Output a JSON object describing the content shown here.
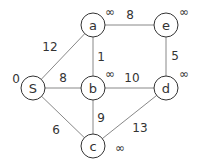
{
  "graph": {
    "nodes": [
      {
        "id": "S",
        "label": "S",
        "dist": "0"
      },
      {
        "id": "a",
        "label": "a",
        "dist": "∞"
      },
      {
        "id": "b",
        "label": "b",
        "dist": "∞"
      },
      {
        "id": "c",
        "label": "c",
        "dist": "∞"
      },
      {
        "id": "d",
        "label": "d",
        "dist": "∞"
      },
      {
        "id": "e",
        "label": "e",
        "dist": "∞"
      }
    ],
    "edges": [
      {
        "from": "S",
        "to": "a",
        "weight": "12"
      },
      {
        "from": "S",
        "to": "b",
        "weight": "8"
      },
      {
        "from": "S",
        "to": "c",
        "weight": "6"
      },
      {
        "from": "a",
        "to": "b",
        "weight": "1"
      },
      {
        "from": "a",
        "to": "e",
        "weight": "8"
      },
      {
        "from": "b",
        "to": "d",
        "weight": "10"
      },
      {
        "from": "b",
        "to": "c",
        "weight": "9"
      },
      {
        "from": "e",
        "to": "d",
        "weight": "5"
      },
      {
        "from": "c",
        "to": "d",
        "weight": "13"
      }
    ]
  }
}
